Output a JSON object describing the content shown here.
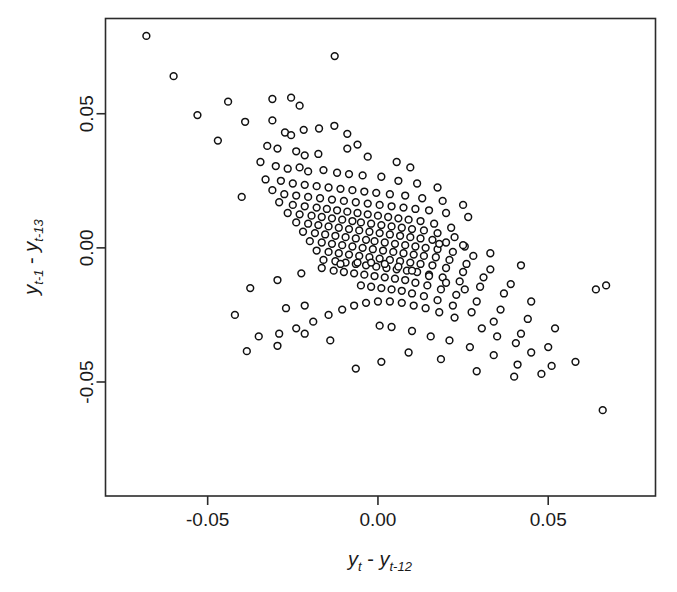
{
  "figure": {
    "background_color": "#ffffff",
    "marker_color": "#111111",
    "marker_fill": "#ffffff",
    "axis_color": "#2b2b2b"
  },
  "axes": {
    "x_title_parts": {
      "y1": "y",
      "sub1": "t",
      "minus": " - ",
      "y2": "y",
      "sub2": "t-12"
    },
    "y_title_parts": {
      "y1": "y",
      "sub1": "t-1",
      "minus": " - ",
      "y2": "y",
      "sub2": "t-13"
    },
    "x_tick_labels": [
      "-0.05",
      "0.00",
      "0.05"
    ],
    "y_tick_labels": [
      "-0.05",
      "0.00",
      "0.05"
    ]
  },
  "chart_data": {
    "type": "scatter",
    "title": "",
    "xlabel": "y_t - y_{t-12}",
    "ylabel": "y_{t-1} - y_{t-13}",
    "xlim": [
      -0.08,
      0.0815
    ],
    "ylim": [
      -0.0925,
      0.0855
    ],
    "xticks": [
      -0.05,
      0.0,
      0.05
    ],
    "yticks": [
      -0.05,
      0.0,
      0.05
    ],
    "grid": false,
    "legend": null,
    "marker": "open-circle",
    "n_points": 272,
    "x": [
      -0.068,
      -0.0127,
      -0.06,
      -0.044,
      -0.031,
      -0.0255,
      -0.023,
      -0.053,
      -0.039,
      -0.031,
      -0.0273,
      -0.0255,
      -0.0218,
      -0.0173,
      -0.0128,
      -0.009,
      -0.047,
      -0.0325,
      -0.0295,
      -0.024,
      -0.0215,
      -0.0175,
      -0.009,
      -0.006,
      -0.003,
      0.0055,
      0.0095,
      -0.0345,
      -0.03,
      -0.0265,
      -0.023,
      -0.0205,
      -0.016,
      -0.012,
      -0.0085,
      -0.0045,
      0.001,
      0.006,
      0.0115,
      0.0175,
      -0.04,
      -0.033,
      -0.0285,
      -0.025,
      -0.0215,
      -0.018,
      -0.0145,
      -0.011,
      -0.0075,
      -0.004,
      -0.0005,
      0.0035,
      0.008,
      0.013,
      0.019,
      0.025,
      -0.031,
      -0.0275,
      -0.024,
      -0.0205,
      -0.017,
      -0.0135,
      -0.01,
      -0.0065,
      -0.003,
      0.0005,
      0.004,
      0.0075,
      0.011,
      0.015,
      0.02,
      0.0265,
      -0.029,
      -0.025,
      -0.0215,
      -0.018,
      -0.015,
      -0.012,
      -0.009,
      -0.006,
      -0.003,
      0.0,
      0.003,
      0.006,
      0.009,
      0.0125,
      0.0165,
      0.0215,
      -0.0265,
      -0.023,
      -0.0195,
      -0.0165,
      -0.0135,
      -0.0105,
      -0.0075,
      -0.005,
      -0.002,
      0.001,
      0.004,
      0.007,
      0.01,
      0.0135,
      0.0175,
      0.0225,
      -0.024,
      -0.0205,
      -0.0175,
      -0.0145,
      -0.0115,
      -0.0085,
      -0.0055,
      -0.0025,
      0.0005,
      0.0035,
      0.0065,
      0.0095,
      0.0125,
      0.016,
      0.02,
      0.0255,
      -0.022,
      -0.0185,
      -0.0155,
      -0.0125,
      -0.0095,
      -0.0065,
      -0.0035,
      -0.001,
      0.002,
      0.005,
      0.008,
      0.011,
      0.014,
      0.0175,
      0.022,
      0.028,
      -0.02,
      -0.0165,
      -0.0135,
      -0.0105,
      -0.0075,
      -0.0045,
      -0.0015,
      0.0015,
      0.0045,
      0.0075,
      0.0105,
      0.0135,
      0.017,
      0.021,
      0.026,
      0.033,
      -0.018,
      -0.0145,
      -0.0115,
      -0.0085,
      -0.0055,
      -0.0025,
      0.0005,
      0.0035,
      0.0065,
      0.0095,
      0.0125,
      0.016,
      0.02,
      0.025,
      0.031,
      0.039,
      -0.016,
      -0.0125,
      -0.0095,
      -0.0065,
      -0.0035,
      -0.0005,
      0.0025,
      0.0055,
      0.0085,
      0.0115,
      0.015,
      0.019,
      0.024,
      0.03,
      0.037,
      0.045,
      -0.013,
      -0.01,
      -0.007,
      -0.004,
      -0.001,
      0.002,
      0.005,
      0.008,
      0.011,
      0.0145,
      0.0185,
      0.023,
      0.029,
      0.036,
      0.044,
      0.052,
      -0.005,
      -0.002,
      0.001,
      0.004,
      0.007,
      0.01,
      0.0135,
      0.0175,
      0.022,
      0.0275,
      0.034,
      0.042,
      0.05,
      0.058,
      0.064,
      0.067,
      0.0305,
      0.035,
      0.0405,
      0.045,
      0.0225,
      0.018,
      0.014,
      0.0105,
      0.007,
      0.0035,
      0.0,
      -0.0035,
      -0.007,
      -0.0105,
      -0.0145,
      -0.019,
      -0.024,
      -0.029,
      -0.035,
      -0.042,
      -0.027,
      -0.0215,
      0.0005,
      0.004,
      0.01,
      0.0155,
      0.021,
      0.027,
      0.034,
      0.041,
      0.048,
      0.0255,
      0.02,
      0.015,
      0.01,
      0.006,
      0.002,
      -0.002,
      -0.006,
      -0.011,
      -0.0165,
      -0.0225,
      -0.0295,
      -0.0375,
      0.018,
      0.025,
      0.033,
      0.042,
      0.066,
      0.051,
      0.04,
      0.029,
      0.0185,
      0.009,
      0.001,
      -0.0065,
      -0.014,
      -0.0215,
      -0.0295,
      -0.0385
    ],
    "y": [
      0.079,
      0.0715,
      0.064,
      0.0545,
      0.0555,
      0.056,
      0.053,
      0.0495,
      0.047,
      0.0475,
      0.043,
      0.042,
      0.044,
      0.0445,
      0.0455,
      0.0425,
      0.04,
      0.038,
      0.037,
      0.036,
      0.0345,
      0.035,
      0.037,
      0.0385,
      0.034,
      0.032,
      0.03,
      0.032,
      0.0305,
      0.0295,
      0.03,
      0.0285,
      0.029,
      0.028,
      0.0275,
      0.027,
      0.0265,
      0.025,
      0.024,
      0.0225,
      0.019,
      0.0255,
      0.025,
      0.024,
      0.0235,
      0.023,
      0.0225,
      0.022,
      0.0215,
      0.021,
      0.0205,
      0.02,
      0.0195,
      0.0185,
      0.0175,
      0.016,
      0.0215,
      0.02,
      0.0195,
      0.019,
      0.0185,
      0.018,
      0.0175,
      0.017,
      0.0165,
      0.016,
      0.0155,
      0.015,
      0.0145,
      0.014,
      0.013,
      0.0115,
      0.017,
      0.016,
      0.0155,
      0.015,
      0.0145,
      0.014,
      0.0135,
      0.013,
      0.0125,
      0.012,
      0.0115,
      0.011,
      0.0105,
      0.01,
      0.009,
      0.0075,
      0.013,
      0.0125,
      0.012,
      0.0115,
      0.011,
      0.0105,
      0.01,
      0.0095,
      0.009,
      0.0085,
      0.008,
      0.0075,
      0.007,
      0.0065,
      0.0055,
      0.004,
      0.0095,
      0.009,
      0.0085,
      0.008,
      0.0075,
      0.007,
      0.0065,
      0.006,
      0.0055,
      0.005,
      0.0045,
      0.004,
      0.0035,
      0.003,
      0.002,
      0.0005,
      0.006,
      0.0055,
      0.005,
      0.0045,
      0.004,
      0.0035,
      0.003,
      0.0025,
      0.002,
      0.0015,
      0.001,
      0.0005,
      0.0,
      -0.0005,
      -0.0015,
      -0.003,
      0.0025,
      0.002,
      0.0015,
      0.001,
      0.0005,
      0.0,
      -0.0005,
      -0.001,
      -0.0015,
      -0.002,
      -0.0025,
      -0.003,
      -0.0035,
      -0.0045,
      -0.006,
      -0.008,
      -0.001,
      -0.0015,
      -0.002,
      -0.0025,
      -0.003,
      -0.0035,
      -0.004,
      -0.0045,
      -0.005,
      -0.0055,
      -0.006,
      -0.0065,
      -0.0075,
      -0.009,
      -0.011,
      -0.0135,
      -0.0045,
      -0.005,
      -0.0055,
      -0.006,
      -0.0065,
      -0.007,
      -0.0075,
      -0.008,
      -0.0085,
      -0.009,
      -0.01,
      -0.011,
      -0.0125,
      -0.0145,
      -0.017,
      -0.02,
      -0.0085,
      -0.009,
      -0.0095,
      -0.01,
      -0.0105,
      -0.011,
      -0.0115,
      -0.012,
      -0.013,
      -0.014,
      -0.0155,
      -0.0175,
      -0.02,
      -0.023,
      -0.0265,
      -0.03,
      -0.014,
      -0.0145,
      -0.015,
      -0.0155,
      -0.016,
      -0.017,
      -0.018,
      -0.0195,
      -0.0215,
      -0.024,
      -0.0275,
      -0.032,
      -0.037,
      -0.0425,
      -0.0155,
      -0.014,
      -0.03,
      -0.033,
      -0.0355,
      -0.039,
      -0.026,
      -0.024,
      -0.0225,
      -0.0215,
      -0.0205,
      -0.02,
      -0.02,
      -0.0205,
      -0.0215,
      -0.023,
      -0.025,
      -0.0275,
      -0.03,
      -0.032,
      -0.033,
      -0.025,
      -0.0225,
      -0.0215,
      -0.029,
      -0.0295,
      -0.031,
      -0.033,
      -0.0345,
      -0.037,
      -0.04,
      -0.0435,
      -0.047,
      -0.0155,
      -0.013,
      -0.0105,
      -0.0085,
      -0.007,
      -0.006,
      -0.0055,
      -0.0055,
      -0.006,
      -0.0075,
      -0.0095,
      -0.012,
      -0.015,
      0.0015,
      0.001,
      -0.002,
      -0.0065,
      -0.0605,
      -0.044,
      -0.048,
      -0.046,
      -0.0415,
      -0.039,
      -0.0425,
      -0.045,
      -0.0345,
      -0.032,
      -0.0365,
      -0.0385
    ]
  }
}
